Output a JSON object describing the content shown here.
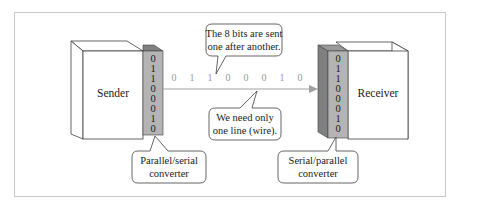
{
  "diagram": {
    "colors": {
      "frame": "#c8c8c8",
      "box_face": "#ffffff",
      "box_stroke": "#404040",
      "converter_face": "#b4b4b4",
      "converter_side": "#808080",
      "line": "#a0a0a0",
      "serial_bits": "#9a9a9a"
    },
    "sender": {
      "label": "Sender",
      "converter_bits": [
        "0",
        "1",
        "1",
        "0",
        "0",
        "0",
        "1",
        "0"
      ]
    },
    "receiver": {
      "label": "Receiver",
      "converter_bits": [
        "0",
        "1",
        "1",
        "0",
        "0",
        "0",
        "1",
        "0"
      ]
    },
    "serial_stream": {
      "bits": [
        "0",
        "1",
        "1",
        "0",
        "0",
        "0",
        "1",
        "0"
      ]
    },
    "callouts": {
      "top": {
        "lines": [
          "The 8 bits are sent",
          "one after another."
        ]
      },
      "bottom": {
        "lines": [
          "We need only",
          "one line (wire)."
        ]
      },
      "sender_converter": {
        "lines": [
          "Parallel/serial",
          "converter"
        ]
      },
      "receiver_converter": {
        "lines": [
          "Serial/parallel",
          "converter"
        ]
      }
    }
  }
}
